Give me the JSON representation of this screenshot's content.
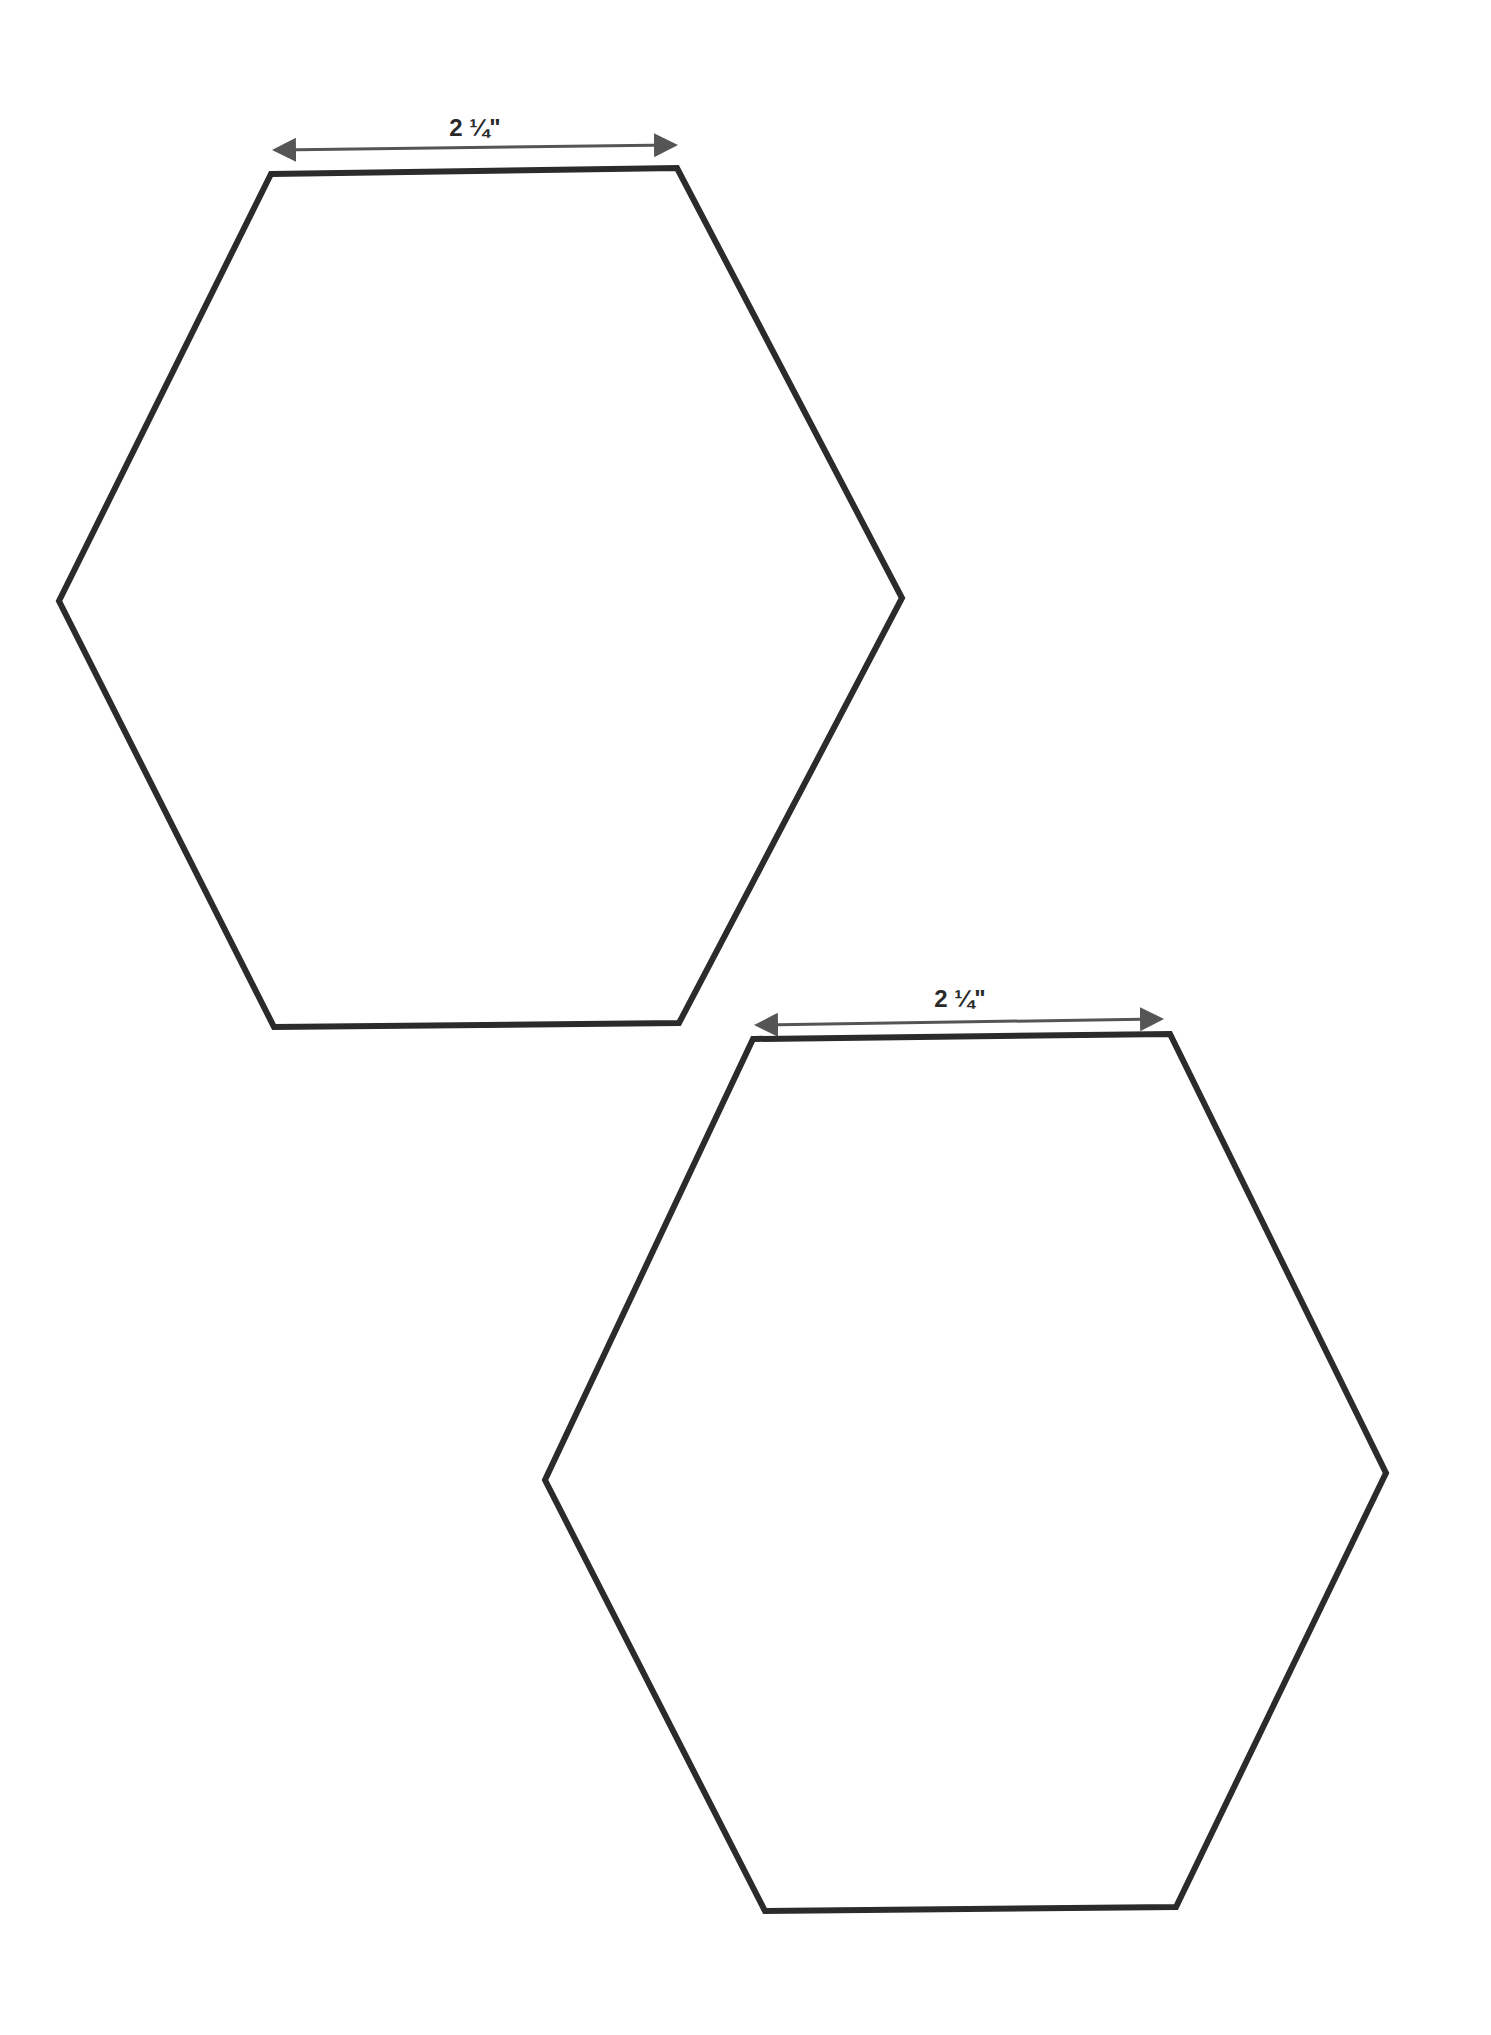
{
  "diagram": {
    "stroke_color": "#2b2b2b",
    "arrow_color": "#555555",
    "hexagons": [
      {
        "name": "hexagon-top",
        "side_label": "2 ¼\"",
        "points": "271,174 677,168 902,598 679,1023 274,1027 59,601",
        "arrow": {
          "x1": 278,
          "y1": 150,
          "x2": 672,
          "y2": 145
        },
        "label_pos": {
          "x": 475,
          "y": 114
        }
      },
      {
        "name": "hexagon-bottom",
        "side_label": "2 ¼\"",
        "points": "753,1039 1170,1034 1386,1473 1176,1907 765,1911 545,1480",
        "arrow": {
          "x1": 760,
          "y1": 1025,
          "x2": 1158,
          "y2": 1019
        },
        "label_pos": {
          "x": 960,
          "y": 985
        }
      }
    ]
  }
}
